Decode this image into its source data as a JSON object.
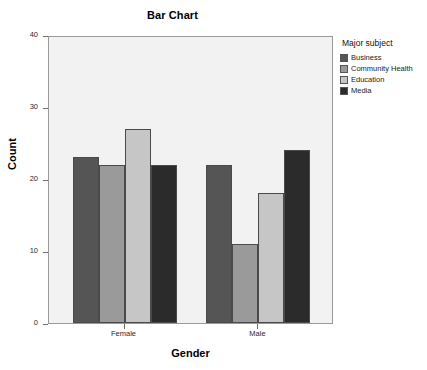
{
  "chart_data": {
    "type": "bar",
    "title": "Bar Chart",
    "xlabel": "Gender",
    "ylabel": "Count",
    "categories": [
      "Female",
      "Male"
    ],
    "series": [
      {
        "name": "Business",
        "values": [
          23,
          22
        ],
        "color": "#555555"
      },
      {
        "name": "Community Health",
        "values": [
          22,
          11
        ],
        "color": "#9a9a9a"
      },
      {
        "name": "Education",
        "values": [
          27,
          18
        ],
        "color": "#c6c6c6"
      },
      {
        "name": "Media",
        "values": [
          22,
          24
        ],
        "color": "#2b2b2b"
      }
    ],
    "ylim": [
      0,
      40
    ],
    "yticks": [
      0,
      10,
      20,
      30,
      40
    ],
    "ytick_labels": [
      "0",
      "10",
      "20",
      "30",
      "40"
    ],
    "grid": false,
    "legend": {
      "title": "Major subject",
      "position": "right",
      "entries": [
        "Business",
        "Community Health",
        "Education",
        "Media"
      ]
    },
    "plot_background": "#f2f2f2",
    "frame_color": "#9a9a9a"
  }
}
